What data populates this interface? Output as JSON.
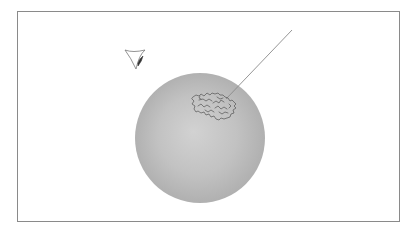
{
  "diagram": {
    "frame": {
      "x": 17,
      "y": 11,
      "width": 383,
      "height": 211,
      "stroke": "#8a8a8a"
    },
    "sphere": {
      "cx": 200,
      "cy": 138,
      "r": 65,
      "highlight_color": "#d2d2d2",
      "mid_color": "#c2c2c2",
      "edge_color": "#acacac",
      "highlight_offset": {
        "fx": "45%",
        "fy": "45%"
      }
    },
    "surface_patch": {
      "description": "irregular squiggly outline region on upper sphere surface",
      "center": {
        "x": 214,
        "y": 104
      },
      "stroke": "#555555"
    },
    "ray_line": {
      "x1": 226,
      "y1": 99,
      "x2": 292,
      "y2": 30,
      "stroke": "#8a8a8a"
    },
    "eye_symbol": {
      "description": "viewpoint / eye glyph (triangular lid with dark pupil)",
      "x": 125,
      "y": 50,
      "stroke": "#777777",
      "pupil_color": "#333333"
    }
  }
}
